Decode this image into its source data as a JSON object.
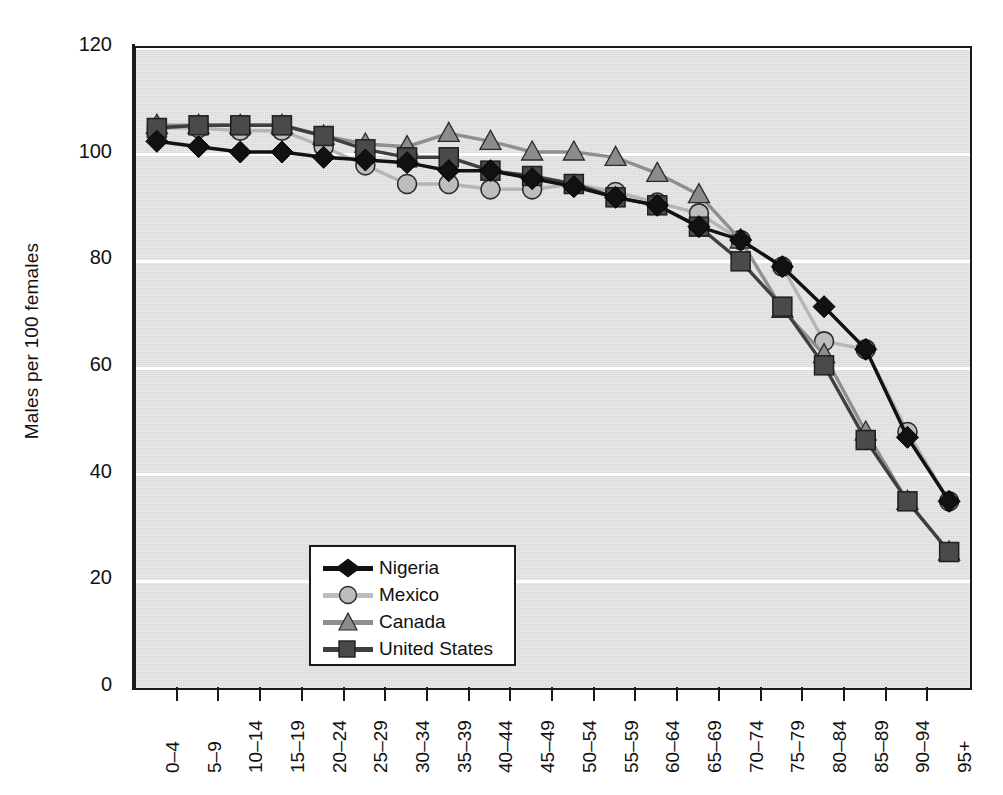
{
  "chart_data": {
    "type": "line",
    "title": "",
    "xlabel": "",
    "ylabel": "Males per 100 females",
    "ylim": [
      0,
      120
    ],
    "yticks": [
      0,
      20,
      40,
      60,
      80,
      100,
      120
    ],
    "grid": true,
    "legend_position": "lower-left-inside",
    "categories": [
      "0–4",
      "5–9",
      "10–14",
      "15–19",
      "20–24",
      "25–29",
      "30–34",
      "35–39",
      "40–44",
      "45–49",
      "50–54",
      "55–59",
      "60–64",
      "65–69",
      "70–74",
      "75–79",
      "80–84",
      "85–89",
      "90–94",
      "95+"
    ],
    "series": [
      {
        "name": "Nigeria",
        "marker": "diamond",
        "color": "#111111",
        "line_color": "#111111",
        "values": [
          102.5,
          101.5,
          100.5,
          100.5,
          99.5,
          99.0,
          98.5,
          97.0,
          97.0,
          95.5,
          94.0,
          92.0,
          90.5,
          86.5,
          84.0,
          79.0,
          71.5,
          63.5,
          47.0,
          35.0
        ]
      },
      {
        "name": "Mexico",
        "marker": "circle",
        "color": "#bdbdbd",
        "line_color": "#b5b5b5",
        "values": [
          105.0,
          105.0,
          104.5,
          104.5,
          101.5,
          98.0,
          94.5,
          94.5,
          93.5,
          93.5,
          94.5,
          93.0,
          91.0,
          89.0,
          84.0,
          79.0,
          65.0,
          63.5,
          48.0,
          35.0
        ]
      },
      {
        "name": "Canada",
        "marker": "triangle",
        "color": "#8c8c8c",
        "line_color": "#8f8f8f",
        "values": [
          105.5,
          105.5,
          105.5,
          105.5,
          103.5,
          102.0,
          101.5,
          104.0,
          102.5,
          100.5,
          100.5,
          99.5,
          96.5,
          92.5,
          84.0,
          71.0,
          62.5,
          48.0,
          35.0,
          25.5
        ]
      },
      {
        "name": "United States",
        "marker": "square",
        "color": "#4a4a4a",
        "line_color": "#3f3f3f",
        "values": [
          105.0,
          105.5,
          105.5,
          105.5,
          103.5,
          101.0,
          99.5,
          99.5,
          97.0,
          96.0,
          94.5,
          92.0,
          90.5,
          86.5,
          80.0,
          71.5,
          60.5,
          46.5,
          35.0,
          25.5
        ]
      }
    ]
  },
  "legend": {
    "items": [
      {
        "label": "Nigeria"
      },
      {
        "label": "Mexico"
      },
      {
        "label": "Canada"
      },
      {
        "label": "United States"
      }
    ]
  }
}
